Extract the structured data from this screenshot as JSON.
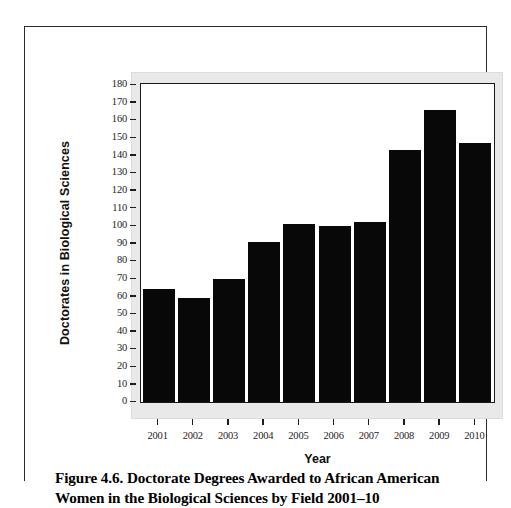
{
  "figure": {
    "caption_line1": "Figure 4.6. Doctorate Degrees Awarded to African American",
    "caption_line2": "Women in the Biological Sciences by Field 2001–10"
  },
  "chart_data": {
    "type": "bar",
    "title": "",
    "xlabel": "Year",
    "ylabel": "Doctorates in Biological Sciences",
    "categories": [
      "2001",
      "2002",
      "2003",
      "2004",
      "2005",
      "2006",
      "2007",
      "2008",
      "2009",
      "2010"
    ],
    "values": [
      64,
      59,
      70,
      91,
      101,
      100,
      102,
      143,
      166,
      147
    ],
    "ylim": [
      0,
      180
    ],
    "ytick_step": 10,
    "yticks": [
      "180",
      "170",
      "160",
      "150",
      "140",
      "130",
      "120",
      "110",
      "100",
      "90",
      "80",
      "70",
      "60",
      "50",
      "40",
      "30",
      "20",
      "10",
      "0"
    ],
    "grid": false,
    "legend": false,
    "bar_color": "#080808",
    "panel_color": "#e9e9e9",
    "plot_background": "#ffffff",
    "axis_color": "#1a1a1a"
  }
}
